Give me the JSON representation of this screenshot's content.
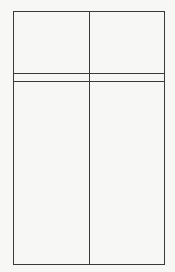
{
  "diagram": {
    "type": "rectangular-grid",
    "colors": {
      "line": "#3a3a3a",
      "background": "#f7f7f6"
    },
    "frame": {
      "x": 13,
      "y": 11,
      "width": 151,
      "height": 253
    },
    "columns": 2,
    "rows": 3,
    "cells": [
      {
        "row": 0,
        "col": 0,
        "text": ""
      },
      {
        "row": 0,
        "col": 1,
        "text": ""
      },
      {
        "row": 1,
        "col": 0,
        "text": ""
      },
      {
        "row": 1,
        "col": 1,
        "text": ""
      },
      {
        "row": 2,
        "col": 0,
        "text": ""
      },
      {
        "row": 2,
        "col": 1,
        "text": ""
      }
    ]
  }
}
